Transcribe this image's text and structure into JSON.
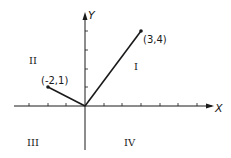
{
  "figure": {
    "axes": {
      "x_label": "X",
      "y_label": "Y",
      "origin_px": [
        85,
        106
      ],
      "unit_px": 18.7,
      "x_ticks": [
        -3,
        -2,
        -1,
        1,
        2,
        3,
        4,
        5,
        6
      ],
      "y_ticks": [
        1,
        2,
        3,
        4
      ]
    },
    "vectors": [
      {
        "from": [
          0,
          0
        ],
        "to": [
          3,
          4
        ],
        "label": "(3,4)"
      },
      {
        "from": [
          0,
          0
        ],
        "to": [
          -2,
          1
        ],
        "label": "(-2,1)"
      }
    ],
    "quadrants": [
      {
        "name": "I",
        "label": "I"
      },
      {
        "name": "II",
        "label": "II"
      },
      {
        "name": "III",
        "label": "III"
      },
      {
        "name": "IV",
        "label": "IV"
      }
    ],
    "colors": {
      "ink": "#1a1a1a",
      "background": "#ffffff"
    }
  }
}
